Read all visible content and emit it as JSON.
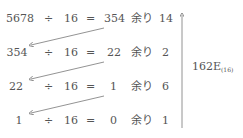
{
  "rows": [
    {
      "dividend": "5678",
      "op": "÷",
      "divisor": "16",
      "eq": "=",
      "quotient": "354",
      "rem_label": "余り",
      "remainder": "14"
    },
    {
      "dividend": "354",
      "op": "÷",
      "divisor": "16",
      "eq": "=",
      "quotient": "22",
      "rem_label": "余り",
      "remainder": "2"
    },
    {
      "dividend": "22",
      "op": "÷",
      "divisor": "16",
      "eq": "=",
      "quotient": "1",
      "rem_label": "余り",
      "remainder": "6"
    },
    {
      "dividend": "1",
      "op": "÷",
      "divisor": "16",
      "eq": "=",
      "quotient": "0",
      "rem_label": "余り",
      "remainder": "1"
    }
  ],
  "result": {
    "value": "162E",
    "base": "(16)"
  },
  "colors": {
    "text": "#555555",
    "arrow": "#777777"
  }
}
